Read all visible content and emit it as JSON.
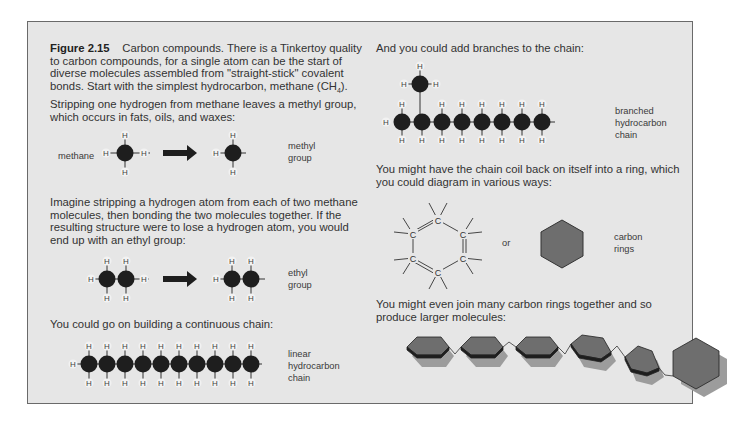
{
  "figure": {
    "number": "Figure 2.15",
    "caption_lines": [
      "Carbon compounds. There is a Tinkertoy quality",
      "to carbon compounds, for a single atom can be the start of",
      "diverse molecules assembled from \"straight-stick\" covalent",
      "bonds. Start with the simplest hydrocarbon, methane (CH",
      "Stripping one hydrogen from methane leaves a methyl group,",
      "which occurs in fats, oils, and waxes:"
    ],
    "formula_subscript": "4",
    "formula_close": ")."
  },
  "left": {
    "methane": {
      "input_label": "methane",
      "output_label_1": "methyl",
      "output_label_2": "group"
    },
    "ethyl_text": [
      "Imagine stripping a hydrogen atom from each of two methane",
      "molecules, then bonding the two molecules together. If the",
      "resulting structure were to lose a hydrogen atom, you would",
      "end up with an ethyl group:"
    ],
    "ethyl": {
      "label_1": "ethyl",
      "label_2": "group"
    },
    "chain_text": "You could go on building a continuous chain:",
    "linear": {
      "label_1": "linear",
      "label_2": "hydrocarbon",
      "label_3": "chain",
      "carbon_count": 10
    }
  },
  "right": {
    "branch_text": "And you could add branches to the chain:",
    "branched": {
      "label_1": "branched",
      "label_2": "hydrocarbon",
      "label_3": "chain",
      "carbon_count": 8
    },
    "ring_text": [
      "You might have the chain coil back on itself into a ring, which",
      "you could diagram in various ways:"
    ],
    "ring": {
      "or_label": "or",
      "label_1": "carbon",
      "label_2": "rings",
      "atom_symbol": "C"
    },
    "polymer_text": [
      "You might even join many carbon rings together and so",
      "produce larger molecules:"
    ]
  },
  "atoms": {
    "hydrogen": "H",
    "carbon": "C"
  },
  "colors": {
    "panel_bg": "#e6e6e6",
    "panel_border": "#6a6a6a",
    "carbon": "#1e1e1e",
    "ring_fill": "#6e6e6e",
    "ring_shadow": "#9c9c9c"
  }
}
